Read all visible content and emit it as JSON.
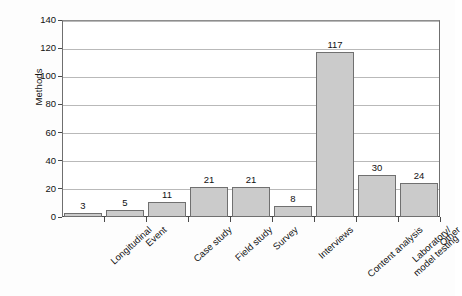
{
  "chart_data": {
    "type": "bar",
    "title": "",
    "subtitle": "",
    "xlabel": "",
    "ylabel": "Methods",
    "ylim": [
      0,
      140
    ],
    "ytick_step": 20,
    "yticks": [
      0,
      20,
      40,
      60,
      80,
      100,
      120,
      140
    ],
    "ytick_labels": [
      "0",
      "20",
      "40",
      "60",
      "80",
      "100",
      "120",
      "140"
    ],
    "grid": true,
    "grid_axis": "y",
    "legend": "none",
    "categories": [
      "Longitudinal",
      "Event",
      "Case study",
      "Field study",
      "Survey",
      "Interviews",
      "Content analysis",
      "Laboratory/\nmodel testing",
      "Other"
    ],
    "category_labels": [
      [
        "Longitudinal"
      ],
      [
        "Event"
      ],
      [
        "Case study"
      ],
      [
        "Field study"
      ],
      [
        "Survey"
      ],
      [
        "Interviews"
      ],
      [
        "Content analysis"
      ],
      [
        "Laboratory/",
        "model testing"
      ],
      [
        "Other"
      ]
    ],
    "values": [
      3,
      5,
      11,
      21,
      21,
      8,
      117,
      30,
      24
    ],
    "value_labels": [
      "3",
      "5",
      "11",
      "21",
      "21",
      "8",
      "117",
      "30",
      "24"
    ],
    "bar_color": "#cbcbcb",
    "bar_border_color": "#707070",
    "grid_color": "#b9b9b9",
    "axis_color": "#4a4a4a",
    "background": "#fdfdfd",
    "plot_background": "#ffffff",
    "label_rotation": -42
  }
}
